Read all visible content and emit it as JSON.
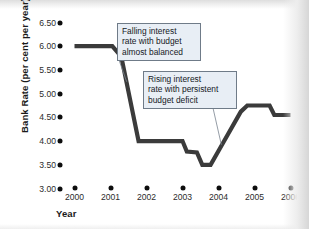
{
  "chart_data": {
    "type": "line",
    "title": "",
    "xlabel": "Year",
    "ylabel": "Bank Rate (per cent per year)",
    "xlim": [
      2000,
      2006
    ],
    "ylim": [
      3.0,
      6.5
    ],
    "grid": false,
    "legend": "none",
    "x_tick_labels": [
      "2000",
      "2001",
      "2002",
      "2003",
      "2004",
      "2005",
      "2006"
    ],
    "x_tick_values": [
      2000,
      2001,
      2002,
      2003,
      2004,
      2005,
      2006
    ],
    "y_tick_labels": [
      "6.50",
      "6.00",
      "5.50",
      "5.00",
      "4.50",
      "4.00",
      "3.50",
      "3.00"
    ],
    "y_tick_values": [
      6.5,
      6.0,
      5.5,
      5.0,
      4.5,
      4.0,
      3.5,
      3.0
    ],
    "series": [
      {
        "name": "Bank Rate",
        "color": "#3b3b3b",
        "x": [
          2000.0,
          2001.05,
          2001.3,
          2001.78,
          2003.0,
          2003.12,
          2003.4,
          2003.55,
          2003.78,
          2004.05,
          2004.62,
          2004.8,
          2005.42,
          2005.55,
          2006.0
        ],
        "values": [
          6.0,
          6.0,
          5.78,
          4.0,
          4.0,
          3.78,
          3.76,
          3.5,
          3.5,
          3.86,
          4.62,
          4.75,
          4.75,
          4.55,
          4.55
        ]
      }
    ],
    "annotations": [
      {
        "id": "falling-rate-note",
        "lines": [
          "Falling interest",
          "rate with budget",
          "almost balanced"
        ],
        "points_to_x": 2001.45,
        "points_to_y": 5.25
      },
      {
        "id": "rising-rate-note",
        "lines": [
          "Rising interest",
          "rate with persistent",
          "budget deficit"
        ],
        "points_to_x": 2004.08,
        "points_to_y": 3.92
      }
    ]
  }
}
